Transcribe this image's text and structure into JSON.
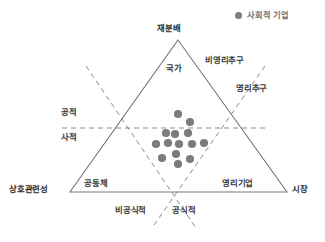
{
  "figure": {
    "type": "ternary-diagram",
    "background_color": "#ffffff",
    "line_color": "#7a7a7a",
    "dash_color": "#8a8a8a",
    "dot_color": "#7c7c7c",
    "text_color": "#2b2b2b"
  },
  "legend": {
    "marker": "filled-circle",
    "marker_color": "#7c7c7c",
    "label": "사회적 기업"
  },
  "vertices": {
    "top": "재분배",
    "bottom_left": "상호관련성",
    "bottom_right": "시장"
  },
  "sector_labels": {
    "top": "국가",
    "bottom_left": "공동체",
    "bottom_right": "영리기업"
  },
  "axis_labels": {
    "upper_right_outer": "비영리추구",
    "upper_right_inner": "영리추구",
    "left_upper": "공적",
    "left_lower": "사적",
    "bottom_left_dash": "비공식적",
    "bottom_right_dash": "공식적"
  },
  "chart_data": {
    "type": "scatter",
    "title": "",
    "xlabel": "",
    "ylabel": "",
    "series": [
      {
        "name": "사회적 기업",
        "color": "#7c7c7c",
        "points": [
          {
            "x": 178,
            "y": 114
          },
          {
            "x": 190,
            "y": 122
          },
          {
            "x": 166,
            "y": 133
          },
          {
            "x": 175,
            "y": 134
          },
          {
            "x": 188,
            "y": 133
          },
          {
            "x": 156,
            "y": 144
          },
          {
            "x": 168,
            "y": 143
          },
          {
            "x": 179,
            "y": 144
          },
          {
            "x": 192,
            "y": 144
          },
          {
            "x": 204,
            "y": 143
          },
          {
            "x": 162,
            "y": 158
          },
          {
            "x": 190,
            "y": 159
          },
          {
            "x": 178,
            "y": 164
          },
          {
            "x": 176,
            "y": 154
          }
        ]
      }
    ]
  },
  "geometry": {
    "triangle": {
      "apex": {
        "x": 178,
        "y": 40
      },
      "left": {
        "x": 70,
        "y": 192
      },
      "right": {
        "x": 287,
        "y": 192
      }
    },
    "horizontal_dashed": {
      "x1": 62,
      "y": 128,
      "x2": 266
    },
    "dashed_left_diagonal": {
      "x1": 86,
      "y1": 66,
      "x2": 196,
      "y2": 228
    },
    "dashed_right_diagonal": {
      "x1": 265,
      "y1": 66,
      "x2": 152,
      "y2": 228
    }
  }
}
